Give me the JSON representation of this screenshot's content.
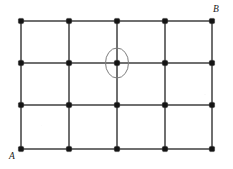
{
  "figure": {
    "type": "lattice-grid-diagram",
    "background_color": "#ffffff",
    "width": 233,
    "height": 169,
    "line_color": "#6f6f6f",
    "node_color": "#141414",
    "highlight_color": "#7d7d7d"
  },
  "chart_data": {
    "type": "scatter",
    "title": "",
    "xlabel": "",
    "ylabel": "",
    "grid": true,
    "legend": "none",
    "columns_x": [
      21,
      69,
      117,
      165,
      212
    ],
    "rows_y": [
      21,
      63,
      105,
      149
    ],
    "column_count": 5,
    "row_count": 4,
    "node_count": 20,
    "x": [
      21,
      69,
      117,
      165,
      212,
      21,
      69,
      117,
      165,
      212,
      21,
      69,
      117,
      165,
      212,
      21,
      69,
      117,
      165,
      212
    ],
    "y": [
      21,
      21,
      21,
      21,
      21,
      63,
      63,
      63,
      63,
      63,
      105,
      105,
      105,
      105,
      105,
      149,
      149,
      149,
      149,
      149
    ],
    "xlim": [
      0,
      233
    ],
    "ylim": [
      0,
      169
    ],
    "node_radius": 2.6,
    "highlight": {
      "shape": "ellipse",
      "cx": 117,
      "cy": 63,
      "rx": 11.5,
      "ry": 15
    }
  },
  "labels": {
    "start": "A",
    "end": "B"
  }
}
